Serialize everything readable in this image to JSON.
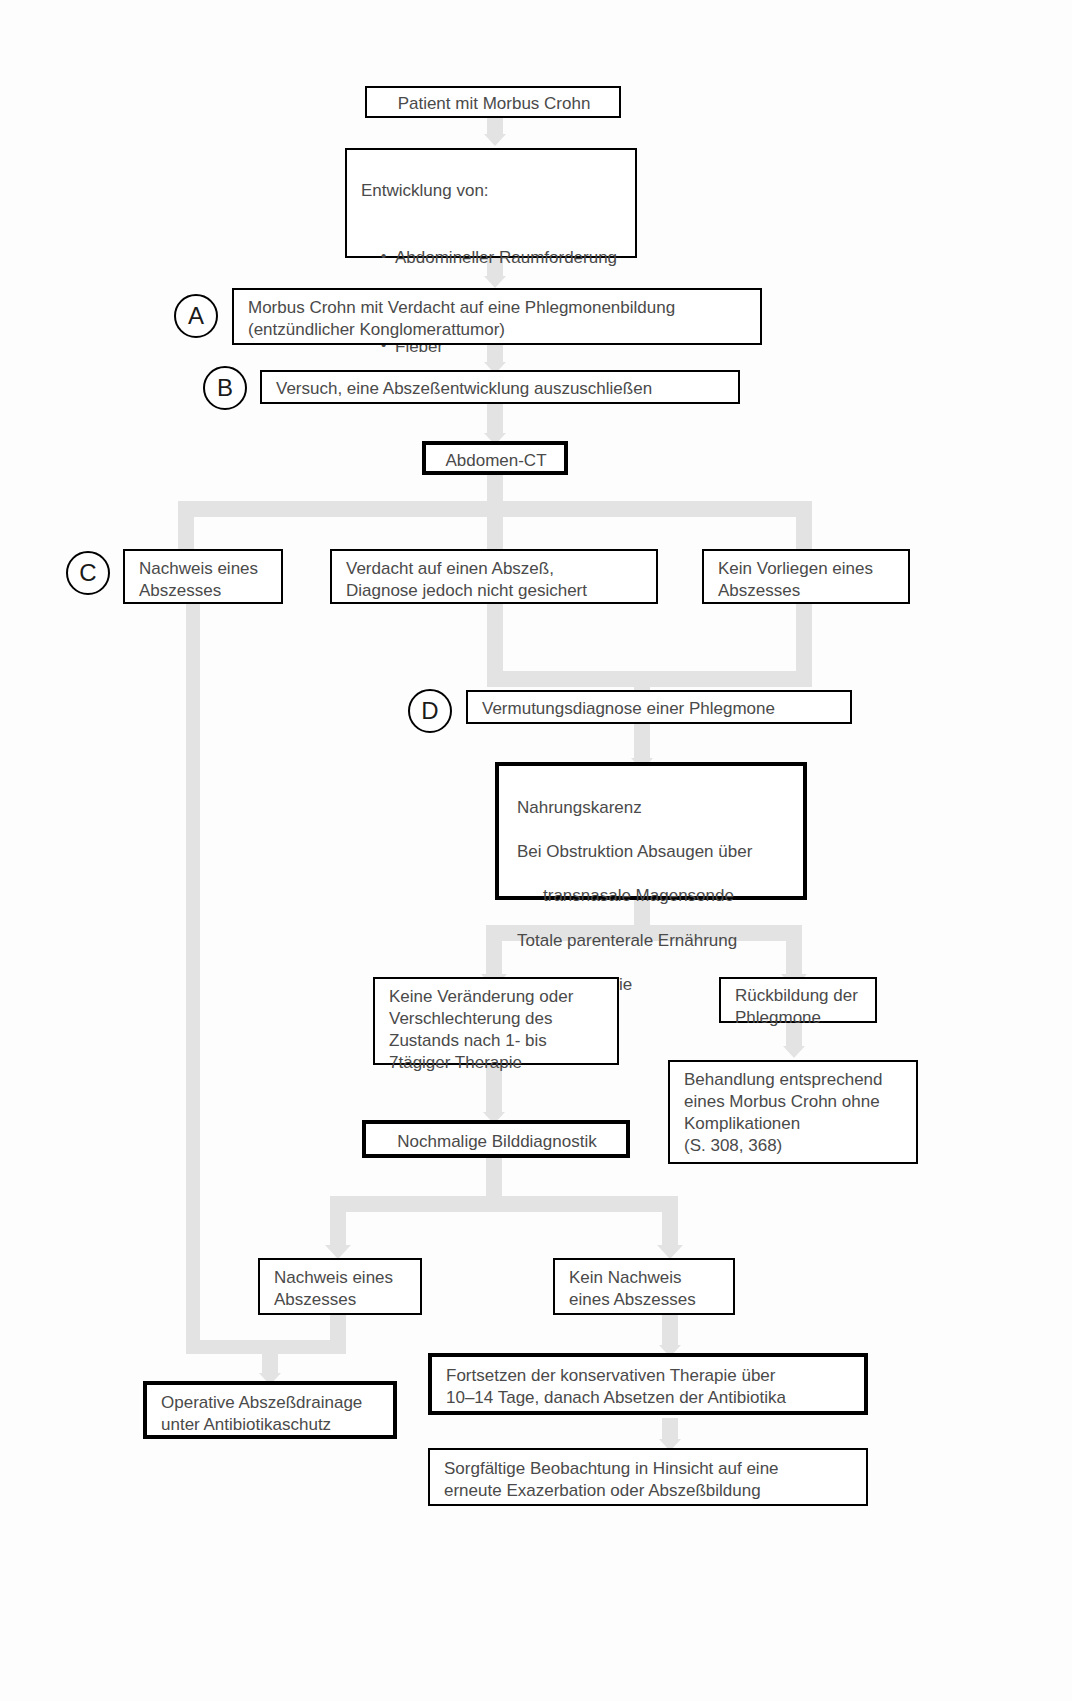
{
  "diagram": {
    "language": "de",
    "accent_line_color": "#e3e3e3",
    "border_color": "#000000",
    "text_color": "#4a4a4a"
  },
  "markers": {
    "a": "A",
    "b": "B",
    "c": "C",
    "d": "D"
  },
  "nodes": {
    "patient": "Patient mit Morbus Crohn",
    "entwicklung_head": "Entwicklung von:",
    "entwicklung_items": [
      "Abdomineller Raumforderung",
      "Lokalisiertem Schmerz",
      "Fieber",
      "Leukozytose"
    ],
    "verdacht_phlegmone": "Morbus Crohn mit Verdacht auf eine Phlegmonenbildung\n(entzündlicher Konglomerattumor)",
    "versuch_ausschluss": "Versuch, eine Abszeßentwicklung auszuschließen",
    "abdomen_ct": "Abdomen-CT",
    "nachweis_abszess_1": "Nachweis eines\nAbszesses",
    "verdacht_abszess": "Verdacht auf einen Abszeß,\nDiagnose jedoch nicht gesichert",
    "kein_vorliegen": "Kein Vorliegen eines\nAbszesses",
    "vermutungsdiagnose": "Vermutungsdiagnose einer Phlegmone",
    "therapie_l1": "Nahrungskarenz",
    "therapie_l2": "Bei Obstruktion Absaugen über",
    "therapie_l3": "transnasale Magensonde",
    "therapie_l4": "Totale parenterale Ernährung",
    "therapie_l5": "Steroidtherapie",
    "therapie_l6": "Antibiotika",
    "keine_veraenderung": "Keine Veränderung oder\nVerschlechterung des\nZustands nach 1- bis\n7tägiger Therapie",
    "rueckbildung": "Rückbildung der\nPhlegmone",
    "behandlung_entsprechend": "Behandlung entsprechend\neines Morbus Crohn ohne\nKomplikationen\n(S. 308, 368)",
    "nochmalige_bilddiagnostik": "Nochmalige Bilddiagnostik",
    "nachweis_abszess_2": "Nachweis eines\nAbszesses",
    "kein_nachweis_abszess": "Kein Nachweis\neines Abszesses",
    "operative_drainage": "Operative Abszeßdrainage\nunter Antibiotikaschutz",
    "fortsetzen_therapie": "Fortsetzen der konservativen Therapie über\n10–14 Tage, danach Absetzen der Antibiotika",
    "sorgfaeltige_beobachtung": "Sorgfältige Beobachtung in Hinsicht auf eine\nerneute Exazerbation oder Abszeßbildung"
  }
}
